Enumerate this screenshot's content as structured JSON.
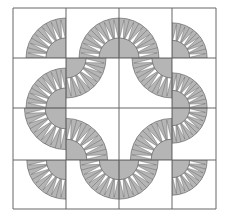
{
  "quilt": {
    "origin": [
      13,
      8
    ],
    "grid_x": [
      13,
      66,
      119,
      172,
      216
    ],
    "grid_y": [
      8,
      58,
      108,
      160,
      209
    ],
    "rows": 4,
    "cols": 4,
    "outer_radius_ratio": 0.8,
    "inner_radius_ratio": 0.4,
    "spikes_per_arc": 6,
    "colors": {
      "background": "#ffffff",
      "fan": "#b5b5b5",
      "spike": "#ffffff",
      "line": "#555555",
      "grid": "#666666"
    },
    "cells": [
      [
        "BR",
        "BR",
        "BL",
        "BL"
      ],
      [
        "BR",
        "TL",
        "TR",
        "BL"
      ],
      [
        "TR",
        "BL",
        "BR",
        "TL"
      ],
      [
        "TR",
        "TR",
        "TL",
        "TL"
      ]
    ]
  }
}
